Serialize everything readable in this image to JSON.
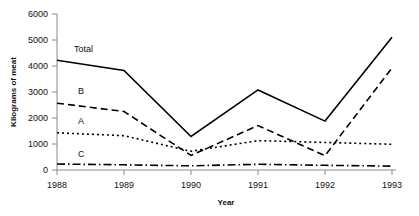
{
  "chart_data": {
    "type": "line",
    "title": "",
    "subtitle": "",
    "xlabel": "Year",
    "ylabel": "Kilograms of meat",
    "x": [
      1988,
      1989,
      1990,
      1991,
      1992,
      1993
    ],
    "xtick_labels": [
      "1988",
      "1989",
      "1990",
      "1991",
      "1992",
      "1993"
    ],
    "ytick_labels": [
      "0",
      "1000",
      "2000",
      "3000",
      "4000",
      "5000",
      "6000"
    ],
    "yticks": [
      0,
      1000,
      2000,
      3000,
      4000,
      5000,
      6000
    ],
    "xlim": [
      1988,
      1993
    ],
    "ylim": [
      0,
      6000
    ],
    "grid": false,
    "legend_position": "inline-labels",
    "series": [
      {
        "name": "Total",
        "label": "Total",
        "linestyle": "solid",
        "color": "#000000",
        "values": [
          4220,
          3830,
          1290,
          3080,
          1880,
          5110
        ]
      },
      {
        "name": "B",
        "label": "B",
        "linestyle": "dashed",
        "color": "#000000",
        "values": [
          2570,
          2250,
          560,
          1710,
          550,
          3930
        ]
      },
      {
        "name": "A",
        "label": "A",
        "linestyle": "dotted",
        "color": "#000000",
        "values": [
          1430,
          1320,
          720,
          1130,
          1060,
          990
        ]
      },
      {
        "name": "C",
        "label": "C",
        "linestyle": "dashdot",
        "color": "#000000",
        "values": [
          230,
          200,
          160,
          220,
          180,
          150
        ]
      }
    ]
  },
  "labels": {
    "total": "Total",
    "b": "B",
    "a": "A",
    "c": "C",
    "y_axis_title": "Kilograms of meat",
    "x_axis_title": "Year",
    "y_6000": "6000",
    "y_5000": "5000",
    "y_4000": "4000",
    "y_3000": "3000",
    "y_2000": "2000",
    "y_1000": "1000",
    "y_0": "0",
    "x_1988": "1988",
    "x_1989": "1989",
    "x_1990": "1990",
    "x_1991": "1991",
    "x_1992": "1992",
    "x_1993": "1993"
  },
  "colors": {
    "axis": "#8a8a8a",
    "line": "#000000",
    "text": "#111111",
    "background": "#ffffff"
  }
}
